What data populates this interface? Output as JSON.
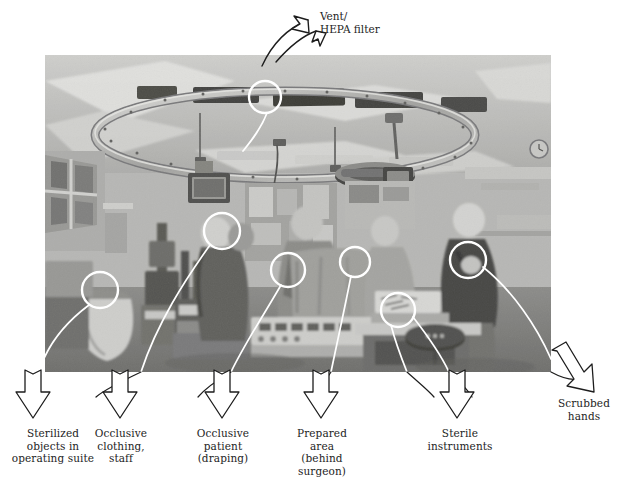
{
  "figure": {
    "kind": "annotated-photograph",
    "background_color": "#ffffff",
    "ink_color": "#1d1d1d",
    "photo": {
      "x": 45,
      "y": 55,
      "width": 506,
      "height": 317,
      "tone": "black-and-white",
      "description_alt": "Black and white photograph of a hospital operating room with surgical team at work beneath a circular ceiling light track and HEPA vent ceiling."
    }
  },
  "annotations": {
    "top_label": {
      "id": "vent-hepa-filter",
      "text": "Vent/\nHEPA filter",
      "x": 322,
      "y": 12,
      "arrow": "curved-double-ended",
      "target_circle": {
        "cx": 265,
        "cy": 97,
        "r": 16
      }
    },
    "callouts": [
      {
        "id": "sterilized-objects",
        "label": "Sterilized\nobjects in\noperating suite",
        "label_x": 6,
        "label_y": 427,
        "label_w": 104,
        "arrow_x": 38,
        "arrow_tip_y": 398,
        "circle": {
          "cx": 100,
          "cy": 290,
          "r": 18
        }
      },
      {
        "id": "occlusive-clothing-staff",
        "label": "Occlusive\nclothing,\nstaff",
        "label_x": 94,
        "label_y": 427,
        "label_w": 86,
        "arrow_x": 125,
        "arrow_tip_y": 398,
        "circle": {
          "cx": 222,
          "cy": 231,
          "r": 18
        }
      },
      {
        "id": "occlusive-patient-draping",
        "label": "Occlusive\npatient\n(draping)",
        "label_x": 196,
        "label_y": 427,
        "label_w": 84,
        "arrow_x": 228,
        "arrow_tip_y": 398,
        "circle": {
          "cx": 288,
          "cy": 270,
          "r": 17
        }
      },
      {
        "id": "prepared-area-behind-surgeon",
        "label": "Prepared\narea\n(behind\nsurgeon)",
        "label_x": 294,
        "label_y": 427,
        "label_w": 82,
        "arrow_x": 327,
        "arrow_tip_y": 398,
        "circle": {
          "cx": 355,
          "cy": 262,
          "r": 15
        }
      },
      {
        "id": "sterile-instruments",
        "label": "Sterile\ninstruments",
        "label_x": 422,
        "label_y": 427,
        "label_w": 94,
        "arrow_x": 461,
        "arrow_tip_y": 398,
        "circle": {
          "cx": 398,
          "cy": 310,
          "r": 17
        }
      },
      {
        "id": "scrubbed-hands",
        "label": "Scrubbed\nhands",
        "label_x": 548,
        "label_y": 398,
        "label_w": 72,
        "arrow_x": 580,
        "arrow_tip_y": 383,
        "circle": {
          "cx": 468,
          "cy": 260,
          "r": 18
        }
      }
    ]
  },
  "photo_scene": {
    "ceiling_ring": "circular overhead light / laminar-flow track",
    "vent_panels": [
      "dark slot vent left",
      "dark slot vent center",
      "dark slot vent right"
    ],
    "people": [
      {
        "id": "anesthetist-left",
        "gown": "dark scrub"
      },
      {
        "id": "surgeon-center",
        "gown": "light sterile gown"
      },
      {
        "id": "assistant-center-right",
        "gown": "draped sterile gown"
      },
      {
        "id": "circulating-nurse-right",
        "gown": "dark scrub"
      }
    ],
    "equipment": [
      "anesthesia machine",
      "instrument trolley",
      "monitor screen",
      "electrosurgical console",
      "waste bag",
      "stool"
    ]
  }
}
